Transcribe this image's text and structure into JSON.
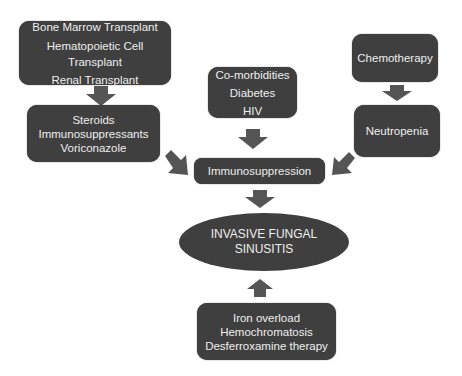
{
  "diagram": {
    "boxes": {
      "transplant": [
        "Bone Marrow Transplant",
        "Hematopoietic Cell",
        "Transplant",
        "Renal Transplant"
      ],
      "drugs": [
        "Steroids",
        "Immunosuppressants",
        "Voriconazole"
      ],
      "comorbidities": [
        "Co-morbidities",
        "Diabetes",
        "HIV"
      ],
      "chemotherapy": [
        "Chemotherapy"
      ],
      "neutropenia": [
        "Neutropenia"
      ],
      "immunosuppression": [
        "Immunosuppression"
      ],
      "outcome": [
        "INVASIVE FUNGAL",
        "SINUSITIS"
      ],
      "iron": [
        "Iron overload",
        "Hemochromatosis",
        "Desferroxamine therapy"
      ]
    },
    "edges": [
      {
        "from": "transplant",
        "to": "drugs"
      },
      {
        "from": "drugs",
        "to": "immunosuppression"
      },
      {
        "from": "comorbidities",
        "to": "immunosuppression"
      },
      {
        "from": "chemotherapy",
        "to": "neutropenia"
      },
      {
        "from": "neutropenia",
        "to": "immunosuppression"
      },
      {
        "from": "immunosuppression",
        "to": "outcome"
      },
      {
        "from": "iron",
        "to": "outcome"
      }
    ],
    "colors": {
      "node_fill": "#3f3f3f",
      "node_text": "#eeeeee",
      "arrow": "#555555"
    }
  }
}
